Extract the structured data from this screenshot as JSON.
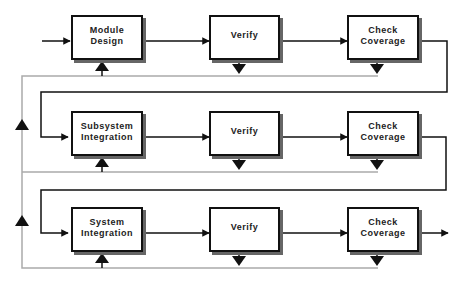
{
  "diagram": {
    "type": "flowchart",
    "rows": [
      {
        "steps": [
          {
            "label": "Module\nDesign"
          },
          {
            "label": "Verify"
          },
          {
            "label": "Check\nCoverage"
          }
        ]
      },
      {
        "steps": [
          {
            "label": "Subsystem\nIntegration"
          },
          {
            "label": "Verify"
          },
          {
            "label": "Check\nCoverage"
          }
        ]
      },
      {
        "steps": [
          {
            "label": "System\nIntegration"
          },
          {
            "label": "Verify"
          },
          {
            "label": "Check\nCoverage"
          }
        ]
      }
    ],
    "colors": {
      "line": "#111111",
      "feedback_line": "#aaaaaa",
      "shadow": "#666666"
    }
  }
}
